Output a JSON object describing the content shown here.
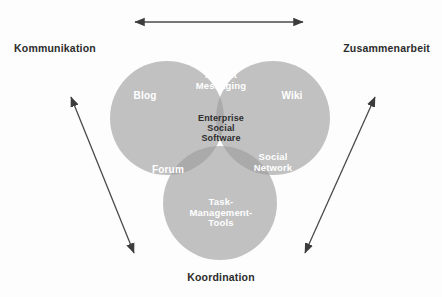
{
  "figure": {
    "type": "venn-diagram-3-set",
    "background_color": "#fdfdfd",
    "center_concept": "Enterprise Social Software"
  },
  "axes": {
    "top_arrow": {
      "name": "horizontal-double-arrow",
      "direction": "double",
      "from": [
        133,
        22
      ],
      "to": [
        305,
        22
      ],
      "color": "#4a4a4a"
    },
    "left_arrow": {
      "name": "diagonal-double-arrow-left",
      "direction": "double",
      "from": [
        69,
        94
      ],
      "to": [
        136,
        256
      ],
      "color": "#4a4a4a"
    },
    "right_arrow": {
      "name": "diagonal-double-arrow-right",
      "direction": "double",
      "from": [
        303,
        256
      ],
      "to": [
        377,
        94
      ],
      "color": "#4a4a4a"
    }
  },
  "corner_labels": {
    "top_left": "Kommunikation",
    "top_right": "Zusammenarbeit",
    "bottom": "Koordination"
  },
  "circles": [
    {
      "id": "kommunikation",
      "name": "circle-kommunikation",
      "cx": 167,
      "cy": 118,
      "r": 57,
      "fill": "#b4b4b4",
      "opacity": 0.78
    },
    {
      "id": "zusammenarbeit",
      "name": "circle-zusammenarbeit",
      "cx": 273,
      "cy": 118,
      "r": 57,
      "fill": "#b4b4b4",
      "opacity": 0.78
    },
    {
      "id": "koordination",
      "name": "circle-koordination",
      "cx": 220,
      "cy": 203,
      "r": 57,
      "fill": "#b4b4b4",
      "opacity": 0.78
    }
  ],
  "regions": [
    {
      "id": "blog",
      "label": "Blog",
      "sets": [
        "kommunikation"
      ],
      "text_color": "#ffffff"
    },
    {
      "id": "wiki",
      "label": "Wiki",
      "sets": [
        "zusammenarbeit"
      ],
      "text_color": "#ffffff"
    },
    {
      "id": "instant-messaging",
      "label": "Instant\nMessaging",
      "sets": [
        "kommunikation",
        "zusammenarbeit"
      ],
      "text_color": "#ffffff"
    },
    {
      "id": "enterprise-social-software",
      "label": "Enterprise\nSocial\nSoftware",
      "sets": [
        "kommunikation",
        "zusammenarbeit",
        "koordination"
      ],
      "text_color": "#2e2e2e"
    },
    {
      "id": "forum",
      "label": "Forum",
      "sets": [
        "kommunikation",
        "koordination"
      ],
      "text_color": "#ffffff"
    },
    {
      "id": "social-network",
      "label": "Social\nNetwork",
      "sets": [
        "zusammenarbeit",
        "koordination"
      ],
      "text_color": "#ffffff"
    },
    {
      "id": "task-management-tools",
      "label": "Task-\nManagement-\nTools",
      "sets": [
        "koordination"
      ],
      "text_color": "#ffffff"
    }
  ]
}
